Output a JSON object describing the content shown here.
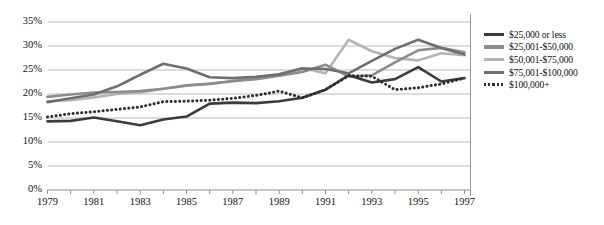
{
  "chart_data": {
    "type": "line",
    "title": "",
    "xlabel": "",
    "ylabel": "",
    "ylim": [
      0,
      35
    ],
    "xlim": [
      1979,
      1997
    ],
    "grid": true,
    "legend_position": "right",
    "y_ticks": [
      "0%",
      "5%",
      "10%",
      "15%",
      "20%",
      "25%",
      "30%",
      "35%"
    ],
    "y_tick_values": [
      0,
      5,
      10,
      15,
      20,
      25,
      30,
      35
    ],
    "x_ticks": [
      "1979",
      "1981",
      "1983",
      "1985",
      "1987",
      "1989",
      "1991",
      "1993",
      "1995",
      "1997"
    ],
    "x": [
      1979,
      1980,
      1981,
      1982,
      1983,
      1984,
      1985,
      1986,
      1987,
      1988,
      1989,
      1990,
      1991,
      1992,
      1993,
      1994,
      1995,
      1996,
      1997
    ],
    "series": [
      {
        "name": "$25,000 or less",
        "color": "#3b3b3b",
        "style": "solid",
        "width": 2.6,
        "values": [
          14.2,
          14.3,
          15.0,
          14.2,
          13.4,
          14.6,
          15.2,
          17.9,
          18.1,
          18.0,
          18.4,
          19.1,
          20.8,
          23.8,
          22.3,
          23.0,
          25.5,
          22.5,
          23.2
        ]
      },
      {
        "name": "$25,001-$50,000",
        "color": "#8c8c8c",
        "style": "solid",
        "width": 2.6,
        "values": [
          19.3,
          19.8,
          20.2,
          20.3,
          20.5,
          21.0,
          21.7,
          22.0,
          22.6,
          23.0,
          23.7,
          24.5,
          26.0,
          23.5,
          23.8,
          26.5,
          29.0,
          29.5,
          28.6
        ]
      },
      {
        "name": "$50,001-$75,000",
        "color": "#b5b5b5",
        "style": "solid",
        "width": 2.6,
        "values": [
          18.4,
          18.6,
          19.2,
          19.9,
          20.2,
          21.0,
          21.6,
          22.1,
          22.5,
          23.2,
          24.0,
          25.3,
          24.2,
          31.2,
          28.8,
          27.4,
          26.9,
          28.4,
          28.0
        ]
      },
      {
        "name": "$75,001-$100,000",
        "color": "#6f6f6f",
        "style": "solid",
        "width": 2.6,
        "values": [
          18.2,
          19.0,
          19.8,
          21.5,
          23.9,
          26.2,
          25.2,
          23.4,
          23.2,
          23.5,
          24.0,
          25.2,
          25.1,
          24.2,
          26.8,
          29.3,
          31.2,
          29.5,
          28.1
        ]
      },
      {
        "name": "$100,000+",
        "color": "#2e2e2e",
        "style": "dotted",
        "width": 2.8,
        "values": [
          15.1,
          15.8,
          16.2,
          16.7,
          17.2,
          18.3,
          18.4,
          18.6,
          19.0,
          19.6,
          20.5,
          19.1,
          20.8,
          23.7,
          23.6,
          20.8,
          21.2,
          22.0,
          23.2
        ]
      }
    ]
  }
}
